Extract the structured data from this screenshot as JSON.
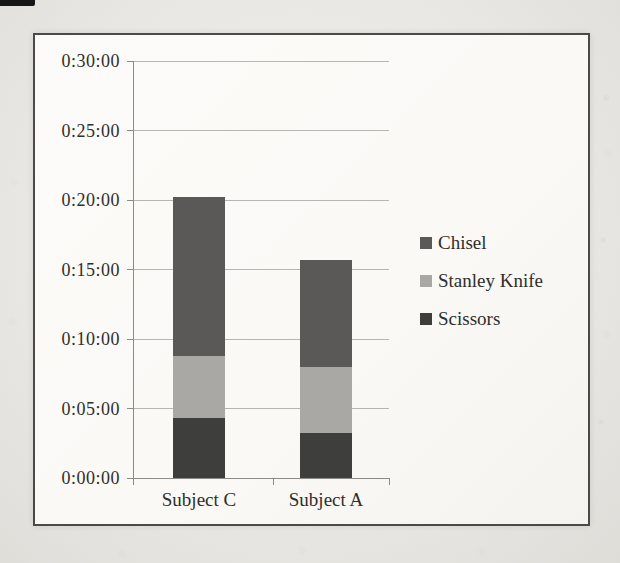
{
  "page": {
    "kind": "scanned page with embedded chart",
    "background_color": "#e9e8e4",
    "frame_border_color": "#4b4a48",
    "text_color": "#2f2e2b",
    "scan_artifact": "black-mark-top-left"
  },
  "chart_data": {
    "type": "bar",
    "stacked": true,
    "title": "",
    "xlabel": "",
    "ylabel": "",
    "unit": "duration h:mm:ss (series values in seconds, estimated from gridlines)",
    "categories": [
      "Subject C",
      "Subject A"
    ],
    "series": [
      {
        "name": "Scissors",
        "color": "#3e3e3d",
        "values": [
          260,
          195
        ]
      },
      {
        "name": "Stanley Knife",
        "color": "#a9a8a5",
        "values": [
          265,
          285
        ]
      },
      {
        "name": "Chisel",
        "color": "#5a5957",
        "values": [
          690,
          460
        ]
      }
    ],
    "totals_seconds": [
      1215,
      940
    ],
    "y_axis": {
      "min": 0,
      "max": 1800,
      "tick_interval": 300,
      "tick_labels": [
        "0:00:00",
        "0:05:00",
        "0:10:00",
        "0:15:00",
        "0:20:00",
        "0:25:00",
        "0:30:00"
      ],
      "gridlines": true
    },
    "legend": {
      "position": "right",
      "entries": [
        "Chisel",
        "Stanley Knife",
        "Scissors"
      ]
    }
  }
}
